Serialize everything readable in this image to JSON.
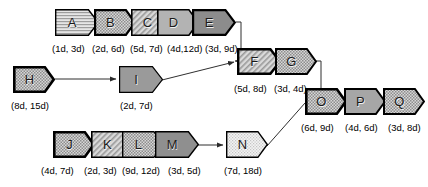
{
  "diagram": {
    "background": "#ffffff",
    "outline_color": "#000000",
    "connector_color": "#333333",
    "nodes": [
      {
        "id": "A",
        "label": "A",
        "duration": "(1d, 3d)",
        "fill": "#d8d8d8",
        "pattern": "horizontal-lines",
        "stroke_width": 1.4,
        "x": 55,
        "y": 9,
        "w": 44,
        "h": 27,
        "label_x": 52,
        "label_y": 44
      },
      {
        "id": "B",
        "label": "B",
        "duration": "(2d, 6d)",
        "fill": "#c9c9c9",
        "pattern": "dots",
        "stroke_width": 2.2,
        "x": 94,
        "y": 9,
        "w": 42,
        "h": 27,
        "label_x": 92,
        "label_y": 44
      },
      {
        "id": "C",
        "label": "C",
        "duration": "(5d, 7d)",
        "fill": "#d0d0d0",
        "pattern": "diagonal-lines",
        "stroke_width": 1.6,
        "x": 131,
        "y": 9,
        "w": 42,
        "h": 27,
        "label_x": 130,
        "label_y": 44
      },
      {
        "id": "D",
        "label": "D",
        "duration": "(4d,12d)",
        "fill": "#b3b3b3",
        "pattern": "solid",
        "stroke_width": 1.6,
        "x": 157,
        "y": 9,
        "w": 42,
        "h": 27,
        "label_x": 167,
        "label_y": 44
      },
      {
        "id": "E",
        "label": "E",
        "duration": "(3d, 9d)",
        "fill": "#8c8c8c",
        "pattern": "solid",
        "stroke_width": 2.2,
        "x": 192,
        "y": 9,
        "w": 44,
        "h": 27,
        "label_x": 205,
        "label_y": 44
      },
      {
        "id": "F",
        "label": "F",
        "duration": "(5d, 8d)",
        "fill": "#c5c5c5",
        "pattern": "diagonal-lines",
        "stroke_width": 2.4,
        "x": 237,
        "y": 48,
        "w": 44,
        "h": 27,
        "label_x": 234,
        "label_y": 84
      },
      {
        "id": "G",
        "label": "G",
        "duration": "(3d, 4d)",
        "fill": "#e2e2e2",
        "pattern": "dots",
        "stroke_width": 2.0,
        "x": 275,
        "y": 48,
        "w": 42,
        "h": 27,
        "label_x": 274,
        "label_y": 84
      },
      {
        "id": "H",
        "label": "H",
        "duration": "(8d, 15d)",
        "fill": "#c2c2c2",
        "pattern": "dots",
        "stroke_width": 2.6,
        "x": 13,
        "y": 66,
        "w": 42,
        "h": 27,
        "label_x": 11,
        "label_y": 101
      },
      {
        "id": "I",
        "label": "I",
        "duration": "(2d, 7d)",
        "fill": "#9a9a9a",
        "pattern": "solid",
        "stroke_width": 1.2,
        "x": 119,
        "y": 66,
        "w": 44,
        "h": 27,
        "label_x": 120,
        "label_y": 101
      },
      {
        "id": "O",
        "label": "O",
        "duration": "(6d, 9d)",
        "fill": "#cfcfcf",
        "pattern": "dots",
        "stroke_width": 2.6,
        "x": 305,
        "y": 88,
        "w": 42,
        "h": 27,
        "label_x": 301,
        "label_y": 123
      },
      {
        "id": "P",
        "label": "P",
        "duration": "(4d, 6d)",
        "fill": "#a6a6a6",
        "pattern": "solid",
        "stroke_width": 2.0,
        "x": 344,
        "y": 88,
        "w": 42,
        "h": 27,
        "label_x": 345,
        "label_y": 123
      },
      {
        "id": "Q",
        "label": "Q",
        "duration": "(3d, 8d)",
        "fill": "#e0e0e0",
        "pattern": "dots",
        "stroke_width": 2.0,
        "x": 383,
        "y": 88,
        "w": 42,
        "h": 27,
        "label_x": 388,
        "label_y": 123
      },
      {
        "id": "J",
        "label": "J",
        "duration": "(4d, 7d)",
        "fill": "#b8b8b8",
        "pattern": "dots",
        "stroke_width": 2.6,
        "x": 53,
        "y": 131,
        "w": 42,
        "h": 27,
        "label_x": 41,
        "label_y": 166
      },
      {
        "id": "K",
        "label": "K",
        "duration": "(2d, 3d)",
        "fill": "#dcdcdc",
        "pattern": "diagonal-lines",
        "stroke_width": 1.6,
        "x": 91,
        "y": 131,
        "w": 42,
        "h": 27,
        "label_x": 84,
        "label_y": 166
      },
      {
        "id": "L",
        "label": "L",
        "duration": "(9d, 12d)",
        "fill": "#cacaca",
        "pattern": "dots",
        "stroke_width": 1.4,
        "x": 122,
        "y": 131,
        "w": 42,
        "h": 27,
        "label_x": 122,
        "label_y": 166
      },
      {
        "id": "M",
        "label": "M",
        "duration": "(3d, 5d)",
        "fill": "#8f8f8f",
        "pattern": "solid",
        "stroke_width": 1.4,
        "x": 155,
        "y": 131,
        "w": 44,
        "h": 27,
        "label_x": 168,
        "label_y": 166
      },
      {
        "id": "N",
        "label": "N",
        "duration": "(7d, 18d)",
        "fill": "#efefef",
        "pattern": "dots-light",
        "stroke_width": 1.4,
        "x": 226,
        "y": 131,
        "w": 42,
        "h": 27,
        "label_x": 224,
        "label_y": 166
      }
    ],
    "connectors": [
      {
        "from": "E",
        "to": "F",
        "kind": "elbow-down",
        "points": "236,23 241,23 241,49",
        "arrow": false
      },
      {
        "from": "E-down",
        "to": "F",
        "kind": "diagonal-in",
        "points": "241,49 241,61 237,61",
        "arrow": true
      },
      {
        "from": "I",
        "to": "F",
        "kind": "diagonal",
        "points": "163,80 236,62",
        "arrow": true
      },
      {
        "from": "H",
        "to": "I",
        "kind": "straight",
        "points": "55,79 118,79",
        "arrow": true
      },
      {
        "from": "G",
        "to": "O",
        "kind": "elbow-down",
        "points": "317,62 321,62 321,101 305,101",
        "arrow": false
      },
      {
        "from": "N",
        "to": "O",
        "kind": "diagonal",
        "points": "268,145 305,102",
        "arrow": false
      },
      {
        "from": "M",
        "to": "N",
        "kind": "straight",
        "points": "199,145 225,145",
        "arrow": true
      }
    ]
  }
}
